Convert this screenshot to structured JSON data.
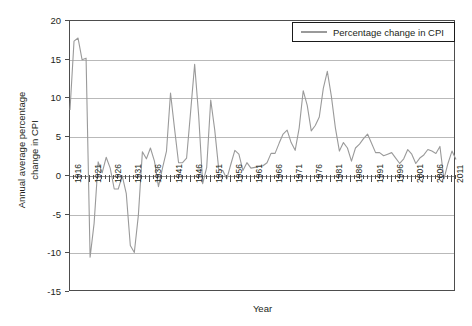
{
  "chart_data": {
    "type": "line",
    "title": "",
    "xlabel": "Year",
    "ylabel": "Annual average percentage change in CPI",
    "ylabel_line1": "Annual average percentage",
    "ylabel_line2": "change in CPI",
    "legend": [
      "Percentage change in CPI"
    ],
    "legend_position": "top-right",
    "grid": true,
    "xlim": [
      1916,
      2012
    ],
    "ylim": [
      -15,
      20
    ],
    "yticks": [
      20,
      15,
      10,
      5,
      0,
      -5,
      -10,
      -15
    ],
    "ytick_labels": [
      "20",
      "15",
      "10",
      "5",
      "0",
      "-5",
      "-10",
      "-15"
    ],
    "xticks": [
      1916,
      1921,
      1926,
      1931,
      1936,
      1941,
      1946,
      1951,
      1956,
      1961,
      1966,
      1971,
      1976,
      1981,
      1986,
      1991,
      1996,
      2001,
      2006,
      2011
    ],
    "xtick_labels": [
      "1916",
      "1921",
      "1926",
      "1931",
      "1936",
      "1941",
      "1946",
      "1951",
      "1956",
      "1961",
      "1966",
      "1971",
      "1976",
      "1981",
      "1986",
      "1991",
      "1996",
      "2001",
      "2006",
      "2011"
    ],
    "xtick_minor_step": 1,
    "line_color": "#9a9a9a",
    "series": [
      {
        "name": "Percentage change in CPI",
        "x": [
          1916,
          1917,
          1918,
          1919,
          1920,
          1921,
          1922,
          1923,
          1924,
          1925,
          1926,
          1927,
          1928,
          1929,
          1930,
          1931,
          1932,
          1933,
          1934,
          1935,
          1936,
          1937,
          1938,
          1939,
          1940,
          1941,
          1942,
          1943,
          1944,
          1945,
          1946,
          1947,
          1948,
          1949,
          1950,
          1951,
          1952,
          1953,
          1954,
          1955,
          1956,
          1957,
          1958,
          1959,
          1960,
          1961,
          1962,
          1963,
          1964,
          1965,
          1966,
          1967,
          1968,
          1969,
          1970,
          1971,
          1972,
          1973,
          1974,
          1975,
          1976,
          1977,
          1978,
          1979,
          1980,
          1981,
          1982,
          1983,
          1984,
          1985,
          1986,
          1987,
          1988,
          1989,
          1990,
          1991,
          1992,
          1993,
          1994,
          1995,
          1996,
          1997,
          1998,
          1999,
          2000,
          2001,
          2002,
          2003,
          2004,
          2005,
          2006,
          2007,
          2008,
          2009,
          2010,
          2011,
          2012
        ],
        "values": [
          8.5,
          17.4,
          17.8,
          15.0,
          15.2,
          -10.5,
          -6.1,
          1.8,
          0.4,
          2.4,
          1.0,
          -1.7,
          -1.7,
          0.0,
          -2.3,
          -9.0,
          -9.9,
          -5.1,
          3.1,
          2.2,
          3.6,
          1.9,
          -1.4,
          1.0,
          3.2,
          10.7,
          6.1,
          1.7,
          1.7,
          2.3,
          8.3,
          14.4,
          7.8,
          -1.0,
          1.1,
          9.8,
          5.9,
          0.8,
          0.7,
          -0.4,
          1.5,
          3.3,
          2.8,
          0.7,
          1.7,
          1.0,
          1.1,
          1.2,
          1.3,
          1.7,
          2.9,
          2.9,
          4.2,
          5.4,
          5.9,
          4.3,
          3.3,
          6.2,
          11.0,
          9.1,
          5.8,
          6.5,
          7.6,
          11.3,
          13.5,
          10.3,
          6.2,
          3.2,
          4.3,
          3.6,
          1.9,
          3.6,
          4.1,
          4.8,
          5.4,
          4.2,
          3.0,
          3.0,
          2.6,
          2.8,
          3.0,
          2.3,
          1.6,
          2.2,
          3.4,
          2.8,
          1.6,
          2.3,
          2.7,
          3.4,
          3.2,
          2.9,
          3.8,
          -0.4,
          1.6,
          3.2,
          2.1
        ]
      }
    ]
  }
}
